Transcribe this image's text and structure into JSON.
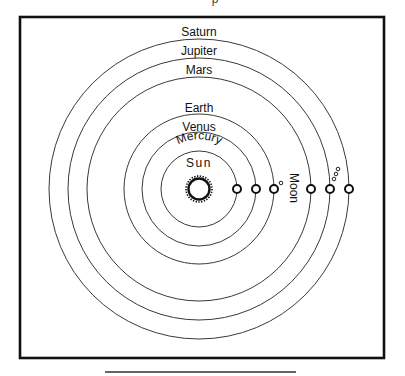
{
  "diagram": {
    "title_fragment": "p",
    "center": {
      "x": 199,
      "y": 189
    },
    "frame": {
      "x": 20,
      "y": 17,
      "width": 364,
      "height": 341
    },
    "bottom_rule": {
      "x1": 105,
      "x2": 296,
      "y": 372
    },
    "sun": {
      "label": "Sun",
      "radius": 11
    },
    "orbits": [
      {
        "name": "Mercury",
        "label": "Mercury",
        "radius": 38,
        "planet_x": 237
      },
      {
        "name": "Venus",
        "label": "Venus",
        "radius": 57,
        "planet_x": 256
      },
      {
        "name": "Earth",
        "label": "Earth",
        "radius": 75,
        "planet_x": 274
      },
      {
        "name": "Mars",
        "label": "Mars",
        "radius": 112,
        "planet_x": 311
      },
      {
        "name": "Jupiter",
        "label": "Jupiter",
        "radius": 131,
        "planet_x": 330
      },
      {
        "name": "Saturn",
        "label": "Saturn",
        "radius": 150,
        "planet_x": 349
      }
    ],
    "moon": {
      "label": "Moon",
      "x": 281,
      "y": 184
    },
    "jupiter_moons": [
      {
        "x": 338,
        "y": 169
      },
      {
        "x": 336,
        "y": 174
      },
      {
        "x": 334,
        "y": 179
      }
    ],
    "colors": {
      "ink": "#111111",
      "orbit_line": "#3a3a3a",
      "background": "#ffffff"
    }
  }
}
